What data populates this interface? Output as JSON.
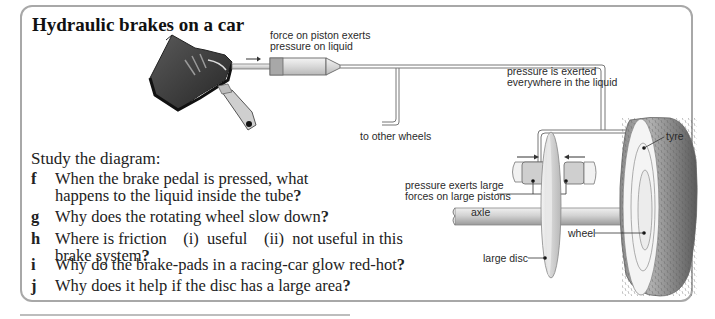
{
  "title": "Hydraulic brakes on a car",
  "intro": "Study the diagram:",
  "questions": [
    {
      "letter": "f",
      "lines": [
        "When the brake pedal is pressed, what",
        "happens to the liquid inside the tube"
      ],
      "end": "?"
    },
    {
      "letter": "g",
      "lines": [
        "Why does the rotating wheel slow down"
      ],
      "end": "?"
    },
    {
      "letter": "h",
      "lines": [
        "Where is friction    (i)  useful    (ii)  not useful in this",
        "brake system"
      ],
      "end": "?"
    },
    {
      "letter": "i",
      "lines": [
        "Why do the brake-pads in a racing-car glow red-hot"
      ],
      "end": "?"
    },
    {
      "letter": "j",
      "lines": [
        "Why does it help if the disc has a large area"
      ],
      "end": "?"
    }
  ],
  "diagram": {
    "labels": {
      "piston_force_1": "force on piston exerts",
      "piston_force_2": "pressure on liquid",
      "pressure_everywhere_1": "pressure is exerted",
      "pressure_everywhere_2": "everywhere in the liquid",
      "other_wheels": "to other wheels",
      "tyre": "tyre",
      "large_pistons_1": "pressure exerts large",
      "large_pistons_2": "forces on large pistons",
      "axle": "axle",
      "wheel": "wheel",
      "large_disc": "large disc"
    },
    "icons": [
      "foot-on-pedal-icon",
      "master-cylinder-icon",
      "brake-caliper-icon",
      "disc-icon",
      "tyre-icon"
    ]
  }
}
